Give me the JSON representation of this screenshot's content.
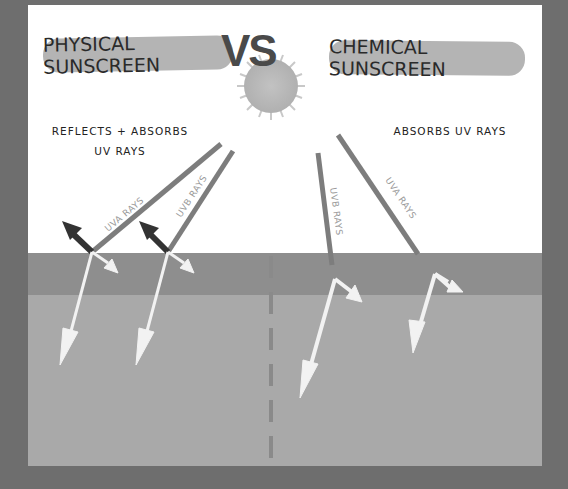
{
  "title": {
    "left": "PHYSICAL SUNSCREEN",
    "vs": "VS",
    "right": "CHEMICAL SUNSCREEN"
  },
  "notes": {
    "physical_line1": "REFLECTS + ABSORBS",
    "physical_line2": "UV RAYS",
    "chemical": "ABSORBS UV RAYS"
  },
  "rays": {
    "physical_uva": "UVA RAYS",
    "physical_uvb": "UVB RAYS",
    "chemical_uvb": "UVB RAYS",
    "chemical_uva": "UVA RAYS"
  },
  "colors": {
    "background": "#6e6e6e",
    "sky": "#ffffff",
    "ground_top": "#8e8e8e",
    "ground_bottom": "#a9a9a9",
    "ray": "#7d7d7d",
    "reflect_arrow": "#333333",
    "absorb_arrow": "#f2f2f2",
    "sun": "#bcbcbc"
  }
}
